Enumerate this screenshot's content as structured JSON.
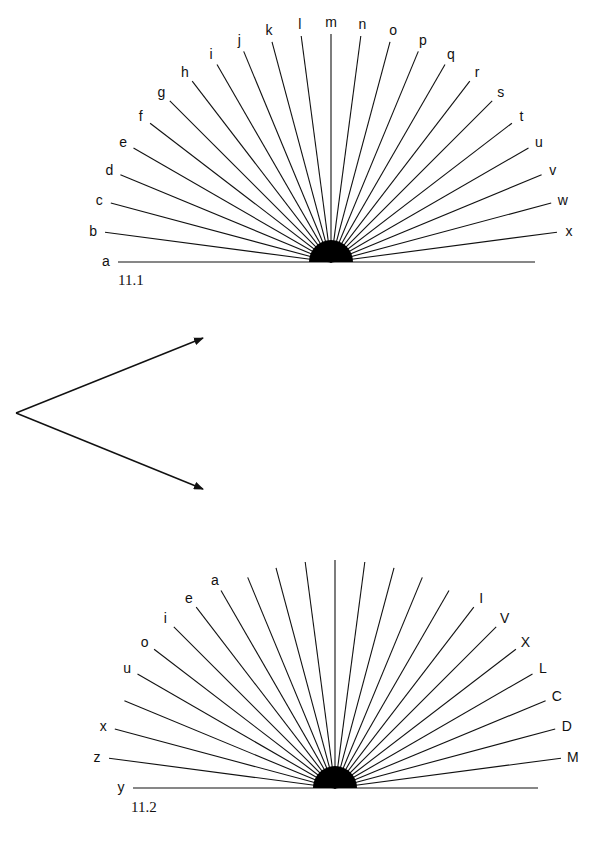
{
  "page": {
    "background": "#ffffff",
    "ink": "#111111"
  },
  "figures": [
    {
      "id": "11.1",
      "caption": "11.1",
      "center": [
        331,
        262
      ],
      "hub_radius": 22,
      "ray_length": 228,
      "horizontal_left_x": 118,
      "horizontal_right_x": 535,
      "step_deg": 7.5,
      "rays": [
        {
          "label": "a"
        },
        {
          "label": "b"
        },
        {
          "label": "c"
        },
        {
          "label": "d"
        },
        {
          "label": "e"
        },
        {
          "label": "f"
        },
        {
          "label": "g"
        },
        {
          "label": "h"
        },
        {
          "label": "i"
        },
        {
          "label": "j"
        },
        {
          "label": "k"
        },
        {
          "label": "l"
        },
        {
          "label": "m"
        },
        {
          "label": "n"
        },
        {
          "label": "o"
        },
        {
          "label": "p"
        },
        {
          "label": "q"
        },
        {
          "label": "r"
        },
        {
          "label": "s"
        },
        {
          "label": "t"
        },
        {
          "label": "u"
        },
        {
          "label": "v"
        },
        {
          "label": "w"
        },
        {
          "label": "x"
        },
        {
          "label": ""
        }
      ]
    },
    {
      "id": "11.2",
      "caption": "11.2",
      "center": [
        335,
        788
      ],
      "hub_radius": 22,
      "ray_length": 228,
      "horizontal_left_x": 133,
      "horizontal_right_x": 538,
      "step_deg": 7.5,
      "rays": [
        {
          "label": "y"
        },
        {
          "label": "z"
        },
        {
          "label": "x"
        },
        {
          "label": ""
        },
        {
          "label": "u"
        },
        {
          "label": "o"
        },
        {
          "label": "i"
        },
        {
          "label": "e"
        },
        {
          "label": "a"
        },
        {
          "label": ""
        },
        {
          "label": ""
        },
        {
          "label": ""
        },
        {
          "label": ""
        },
        {
          "label": ""
        },
        {
          "label": ""
        },
        {
          "label": ""
        },
        {
          "label": ""
        },
        {
          "label": "I"
        },
        {
          "label": "V"
        },
        {
          "label": "X"
        },
        {
          "label": "L"
        },
        {
          "label": "C"
        },
        {
          "label": "D"
        },
        {
          "label": "M"
        },
        {
          "label": ""
        }
      ]
    }
  ],
  "arrows": {
    "origin": [
      16,
      413
    ],
    "tips": [
      [
        203,
        338
      ],
      [
        203,
        489
      ]
    ]
  }
}
